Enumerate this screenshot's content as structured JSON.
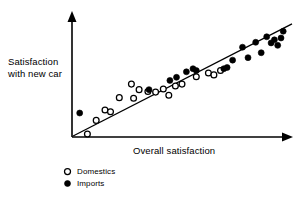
{
  "chart_data": {
    "type": "scatter",
    "title": "",
    "xlabel": "Overall satisfaction",
    "ylabel": "Satisfaction\nwith new car",
    "grid": false,
    "axes_style": "arrow-tipped, unscaled",
    "xlim": [
      0,
      100
    ],
    "ylim": [
      0,
      100
    ],
    "tick_labels": {
      "x": [],
      "y": []
    },
    "legend": {
      "position": "below-axis-left",
      "entries": [
        {
          "label": "Domestics",
          "marker": "open-circle"
        },
        {
          "label": "Imports",
          "marker": "filled-circle"
        }
      ]
    },
    "annotations": [],
    "trend_line": {
      "label": "",
      "x": [
        0.5,
        100.0
      ],
      "y": [
        0.8,
        92.0
      ]
    },
    "series": [
      {
        "name": "Domestics",
        "marker": "open-circle",
        "points": [
          [
            7.0,
            2.5
          ],
          [
            11.0,
            13.5
          ],
          [
            15.0,
            22.0
          ],
          [
            17.5,
            20.5
          ],
          [
            21.5,
            32.0
          ],
          [
            27.0,
            43.0
          ],
          [
            28.0,
            31.5
          ],
          [
            30.5,
            38.5
          ],
          [
            34.5,
            37.0
          ],
          [
            38.0,
            36.5
          ],
          [
            41.5,
            39.0
          ],
          [
            44.0,
            34.0
          ],
          [
            47.0,
            41.5
          ],
          [
            50.0,
            43.0
          ],
          [
            56.5,
            49.0
          ],
          [
            62.0,
            52.0
          ],
          [
            64.5,
            50.5
          ],
          [
            67.5,
            54.0
          ]
        ]
      },
      {
        "name": "Imports",
        "marker": "filled-circle",
        "points": [
          [
            3.5,
            19.5
          ],
          [
            35.0,
            38.5
          ],
          [
            44.5,
            46.0
          ],
          [
            47.5,
            48.5
          ],
          [
            52.0,
            53.0
          ],
          [
            55.0,
            55.5
          ],
          [
            56.5,
            54.0
          ],
          [
            69.0,
            55.5
          ],
          [
            70.5,
            56.5
          ],
          [
            73.0,
            62.5
          ],
          [
            77.5,
            73.0
          ],
          [
            80.0,
            64.5
          ],
          [
            83.5,
            77.0
          ],
          [
            86.0,
            68.5
          ],
          [
            88.5,
            81.5
          ],
          [
            90.5,
            76.5
          ],
          [
            92.0,
            79.0
          ],
          [
            93.5,
            74.5
          ],
          [
            95.0,
            80.5
          ],
          [
            96.0,
            86.0
          ]
        ]
      }
    ]
  },
  "geometry": {
    "origin": {
      "x": 72,
      "y": 137
    },
    "x_axis_end": {
      "x": 292,
      "y": 137
    },
    "y_axis_end": {
      "x": 72,
      "y": 14
    }
  }
}
